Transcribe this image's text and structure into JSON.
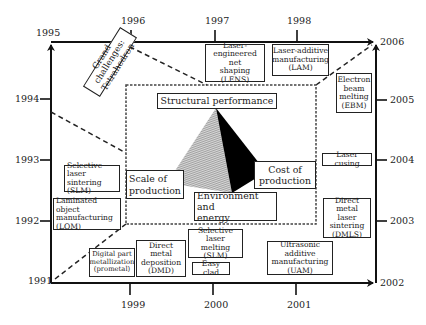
{
  "diagram": {
    "title_concept": "Grand challenges: Tetrahedron",
    "axes": {
      "left": {
        "start": "1991",
        "end": "1995",
        "ticks": [
          "1992",
          "1993",
          "1994"
        ]
      },
      "top": {
        "start": "1995",
        "end": "2006",
        "ticks": [
          "1996",
          "1997",
          "1998"
        ]
      },
      "right": {
        "start": "2006",
        "end": "2002",
        "ticks": [
          "2005",
          "2004",
          "2003"
        ]
      },
      "bottom": {
        "start": "1991",
        "end": "2002",
        "ticks": [
          "1999",
          "2000",
          "2001"
        ]
      }
    },
    "year_labels": {
      "y1991": "1991",
      "y1992": "1992",
      "y1993": "1993",
      "y1994": "1994",
      "y1995": "1995",
      "y1996": "1996",
      "y1997": "1997",
      "y1998": "1998",
      "y1999": "1999",
      "y2000": "2000",
      "y2001": "2001",
      "y2002": "2002",
      "y2003": "2003",
      "y2004": "2004",
      "y2005": "2005",
      "y2006": "2006"
    },
    "tetrahedron": {
      "label": "Grand challenges: Tetrahedron",
      "vertices": {
        "top": "Structural performance",
        "left": "Scale of production",
        "right": "Cost of production",
        "bottom": "Environment and energy"
      },
      "colors": {
        "hatched_face": "#9a9a9a",
        "dark_face": "#000000"
      }
    },
    "technologies": [
      {
        "id": "lens",
        "label": "Laser-engineered net shaping (LENS)",
        "year": "1997"
      },
      {
        "id": "lam",
        "label": "Laser-additive manufacturing (LAM)",
        "year": "1998"
      },
      {
        "id": "ebm",
        "label": "Electron beam melting (EBM)",
        "year": "2005"
      },
      {
        "id": "laser_cusing",
        "label": "Laser cusing",
        "year": "2004"
      },
      {
        "id": "dmls",
        "label": "Direct metal laser sintering (DMLS)",
        "year": "2003"
      },
      {
        "id": "uam",
        "label": "Ultrasonic additive manufacturing (UAM)",
        "year": "2001"
      },
      {
        "id": "slm_melting",
        "label": "Selective laser melting (SLM)",
        "year": "2000"
      },
      {
        "id": "easy_clad",
        "label": "Easy clad",
        "year": "2000"
      },
      {
        "id": "dmd",
        "label": "Direct metal deposition (DMD)",
        "year": "1999"
      },
      {
        "id": "prometal",
        "label": "Digital part metallization (prometal)",
        "year": "1999"
      },
      {
        "id": "lom",
        "label": "Laminated object manufacturing (LOM)",
        "year": "1992"
      },
      {
        "id": "sls",
        "label": "Selective laser sintering (SLM)",
        "year": "1993"
      }
    ],
    "box_text": {
      "lens": [
        "Laser-",
        "engineered net",
        "shaping (LENS)"
      ],
      "lam": [
        "Laser-additive",
        "manufacturing",
        "(LAM)"
      ],
      "ebm": [
        "Electron",
        "beam",
        "melting",
        "(EBM)"
      ],
      "laser_cusing": [
        "Laser cusing"
      ],
      "dmls": [
        "Direct metal",
        "laser",
        "sintering",
        "(DMLS)"
      ],
      "uam": [
        "Ultrasonic additive",
        "manufacturing",
        "(UAM)"
      ],
      "slm_melting": [
        "Selective",
        "laser melting",
        "(SLM)"
      ],
      "easy_clad": [
        "Easy clad"
      ],
      "dmd": [
        "Direct metal",
        "deposition",
        "(DMD)"
      ],
      "prometal": [
        "Digital part",
        "metallization",
        "(prometal)"
      ],
      "lom": [
        "Laminated object",
        "manufacturing",
        "(LOM)"
      ],
      "sls": [
        "Selective laser",
        "sintering (SLM)"
      ],
      "structural": [
        "Structural performance"
      ],
      "scale": [
        "Scale of",
        "production"
      ],
      "cost": [
        "Cost of",
        "production"
      ],
      "env": [
        "Environment and",
        "energy"
      ],
      "grand": [
        "Grand challenges:",
        "Tetrahedron"
      ]
    }
  }
}
